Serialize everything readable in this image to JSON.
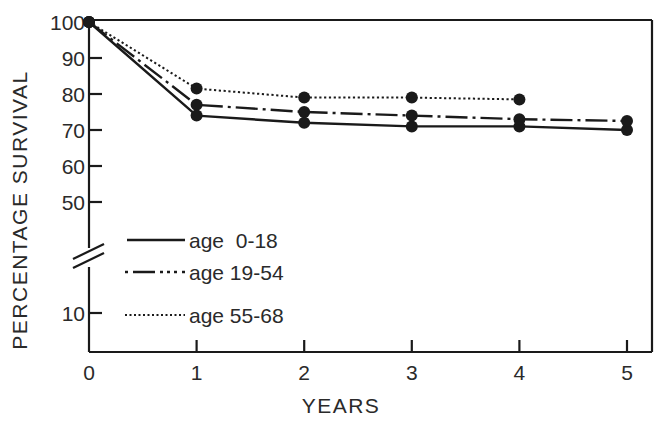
{
  "chart_data": {
    "type": "line",
    "title": "",
    "xlabel": "YEARS",
    "ylabel": "PERCENTAGE SURVIVAL",
    "x": [
      0,
      1,
      2,
      3,
      4,
      5
    ],
    "xticks": [
      "0",
      "1",
      "2",
      "3",
      "4",
      "5"
    ],
    "yticks": [
      "100",
      "90",
      "80",
      "70",
      "60",
      "50",
      "10"
    ],
    "ylim": [
      0,
      100
    ],
    "axis_break": "between 10 and 50",
    "grid": false,
    "legend_position": "lower-left inside plot",
    "series": [
      {
        "name": "age 0-18",
        "style": "solid",
        "x": [
          0,
          1,
          2,
          3,
          4,
          5
        ],
        "values": [
          100,
          74,
          72,
          71,
          71,
          70
        ]
      },
      {
        "name": "age 19-54",
        "style": "dash-dot",
        "x": [
          0,
          1,
          2,
          3,
          4,
          5
        ],
        "values": [
          100,
          77,
          75,
          74,
          73,
          72.5
        ]
      },
      {
        "name": "age 55-68",
        "style": "dotted",
        "x": [
          0,
          1,
          2,
          3,
          4
        ],
        "values": [
          100,
          81.5,
          79,
          79,
          78.5
        ]
      }
    ]
  },
  "legend": {
    "items": [
      {
        "label": "age  0-18"
      },
      {
        "label": "age 19-54"
      },
      {
        "label": "age 55-68"
      }
    ]
  },
  "colors": {
    "ink": "#1a1a1a",
    "background": "#ffffff"
  }
}
